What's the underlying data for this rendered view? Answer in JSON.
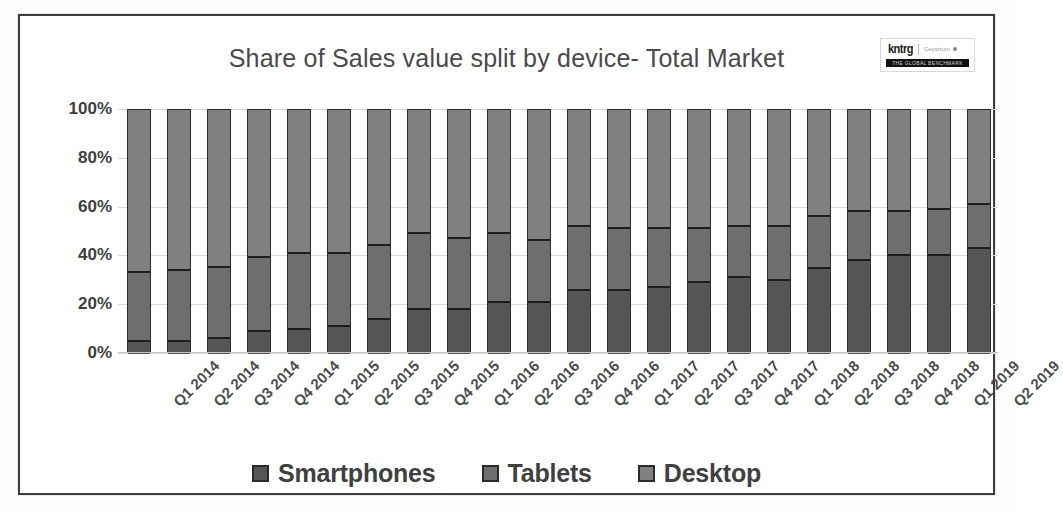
{
  "frame": {
    "logo": {
      "mark": "kntrg",
      "sub": "Cepstrum",
      "banner": "THE GLOBAL BENCHMARK"
    }
  },
  "chart_data": {
    "type": "bar",
    "subtype": "stacked-percent",
    "title": "Share of Sales value split by device- Total Market",
    "xlabel": "",
    "ylabel": "",
    "ylim": [
      0,
      100
    ],
    "yticks": [
      "0%",
      "20%",
      "40%",
      "60%",
      "80%",
      "100%"
    ],
    "ytick_values": [
      0,
      20,
      40,
      60,
      80,
      100
    ],
    "grid": true,
    "legend_position": "bottom",
    "colors": {
      "smartphones": "#555555",
      "tablets": "#6e6e6e",
      "desktop": "#808080"
    },
    "categories": [
      "Q1 2014",
      "Q2 2014",
      "Q3 2014",
      "Q4 2014",
      "Q1 2015",
      "Q2 2015",
      "Q3 2015",
      "Q4 2015",
      "Q1 2016",
      "Q2 2016",
      "Q3 2016",
      "Q4 2016",
      "Q1 2017",
      "Q2 2017",
      "Q3 2017",
      "Q4 2017",
      "Q1 2018",
      "Q2 2018",
      "Q3 2018",
      "Q4 2018",
      "Q1 2019",
      "Q2 2019"
    ],
    "series": [
      {
        "name": "Smartphones",
        "color": "#555555",
        "values": [
          5,
          5,
          6,
          9,
          10,
          11,
          14,
          18,
          18,
          21,
          21,
          26,
          26,
          27,
          29,
          31,
          30,
          35,
          38,
          40,
          40,
          43
        ]
      },
      {
        "name": "Tablets",
        "color": "#6e6e6e",
        "values": [
          29,
          30,
          30,
          31,
          32,
          31,
          31,
          32,
          30,
          29,
          26,
          27,
          26,
          25,
          23,
          22,
          23,
          22,
          21,
          19,
          20,
          19
        ]
      },
      {
        "name": "Desktop",
        "color": "#808080",
        "values": [
          66,
          65,
          64,
          60,
          58,
          58,
          55,
          50,
          52,
          50,
          53,
          47,
          48,
          48,
          48,
          47,
          47,
          43,
          41,
          41,
          40,
          38
        ]
      }
    ],
    "cumulative_tops": {
      "smartphones": [
        5,
        5,
        6,
        9,
        10,
        11,
        14,
        18,
        18,
        21,
        21,
        26,
        26,
        27,
        29,
        31,
        30,
        35,
        38,
        40,
        40,
        43
      ],
      "tablets": [
        34,
        35,
        36,
        40,
        42,
        42,
        45,
        50,
        48,
        50,
        47,
        53,
        52,
        52,
        52,
        53,
        53,
        57,
        59,
        59,
        60,
        62
      ]
    }
  },
  "legend": {
    "items": [
      {
        "label": "Smartphones",
        "color": "#555555"
      },
      {
        "label": "Tablets",
        "color": "#6e6e6e"
      },
      {
        "label": "Desktop",
        "color": "#808080"
      }
    ]
  }
}
